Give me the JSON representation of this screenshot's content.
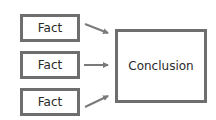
{
  "diagram": {
    "facts": [
      {
        "label": "Fact"
      },
      {
        "label": "Fact"
      },
      {
        "label": "Fact"
      }
    ],
    "conclusion": {
      "label": "Conclusion"
    },
    "colors": {
      "border": "#6e6e6e",
      "arrow": "#7a7a7a",
      "text": "#2a2a2a"
    }
  }
}
